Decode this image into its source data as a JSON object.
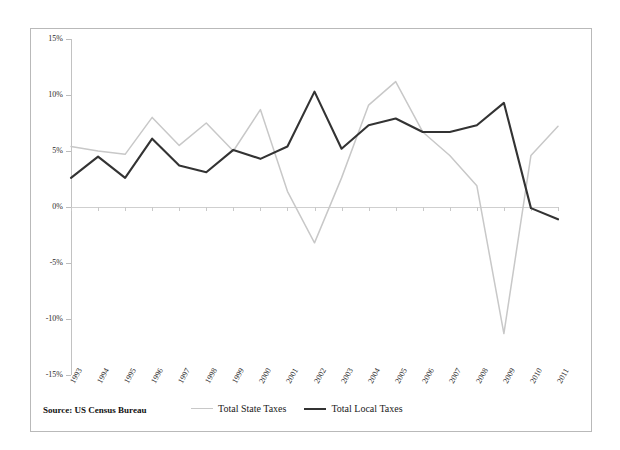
{
  "source": {
    "label": "Source: US Census Bureau"
  },
  "colors": {
    "state": "#c8c8c8",
    "local": "#333333",
    "axis": "#c2c2c2",
    "zero_line": "#cfcfcf",
    "frame": "#b9b9b9",
    "text": "#2a2a2a"
  },
  "legend": {
    "position": "bottom",
    "entries": [
      {
        "label": "Total State Taxes",
        "color_key": "state"
      },
      {
        "label": "Total Local Taxes",
        "color_key": "local"
      }
    ]
  },
  "axes": {
    "y_ticks": [
      "15%",
      "10%",
      "5%",
      "0%",
      "-5%",
      "-10%",
      "-15%"
    ],
    "y_tick_values": [
      15,
      10,
      5,
      0,
      -5,
      -10,
      -15
    ],
    "x_ticks": [
      "1993",
      "1994",
      "1995",
      "1996",
      "1997",
      "1998",
      "1999",
      "2000",
      "2001",
      "2002",
      "2003",
      "2004",
      "2005",
      "2006",
      "2007",
      "2008",
      "2009",
      "2010",
      "2011"
    ]
  },
  "chart_data": {
    "type": "line",
    "title": "",
    "subtitle": "",
    "xlabel": "",
    "ylabel": "",
    "ylim": [
      -15,
      15
    ],
    "grid": false,
    "legend_position": "bottom",
    "categories": [
      "1993",
      "1994",
      "1995",
      "1996",
      "1997",
      "1998",
      "1999",
      "2000",
      "2001",
      "2002",
      "2003",
      "2004",
      "2005",
      "2006",
      "2007",
      "2008",
      "2009",
      "2010",
      "2011"
    ],
    "series": [
      {
        "name": "Total State Taxes",
        "color": "#c8c8c8",
        "values": [
          5.4,
          5.0,
          4.7,
          8.0,
          5.5,
          7.5,
          5.0,
          8.7,
          1.4,
          -3.2,
          2.6,
          9.1,
          11.2,
          6.7,
          4.6,
          1.9,
          -11.3,
          4.6,
          7.2
        ]
      },
      {
        "name": "Total Local Taxes",
        "color": "#333333",
        "values": [
          2.6,
          4.5,
          2.6,
          6.1,
          3.7,
          3.1,
          5.1,
          4.3,
          5.4,
          10.3,
          5.2,
          7.3,
          7.9,
          6.7,
          6.7,
          7.3,
          9.3,
          -0.1,
          -1.1
        ]
      }
    ]
  }
}
